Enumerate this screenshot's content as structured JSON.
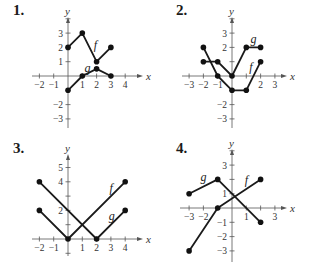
{
  "chart_data": [
    {
      "type": "line",
      "number": "1.",
      "unit_px": 14.3,
      "origin_px": [
        68,
        76
      ],
      "xlim": [
        -2,
        4
      ],
      "ylim": [
        -3,
        4
      ],
      "x_axis_px": [
        32,
        140
      ],
      "y_axis_px": [
        20,
        128
      ],
      "x_ticks": [
        -2,
        -1,
        1,
        2,
        3,
        4
      ],
      "y_ticks": [
        -3,
        -2,
        1,
        2,
        3,
        4
      ],
      "x_tick_labels": [
        "-2",
        "-1",
        "1",
        "2",
        "3",
        "4"
      ],
      "y_tick_labels": [
        "-3",
        "-2",
        "1",
        "2",
        "3",
        ""
      ],
      "xlabel": "x",
      "ylabel": "y",
      "series": [
        {
          "name": "f",
          "points": [
            [
              0,
              2
            ],
            [
              1,
              3
            ],
            [
              2,
              1
            ],
            [
              3,
              2
            ]
          ],
          "label_pos": [
            1.8,
            1.9
          ]
        },
        {
          "name": "g",
          "points": [
            [
              0,
              -1
            ],
            [
              1,
              0
            ],
            [
              2,
              0.5
            ],
            [
              3,
              0
            ]
          ],
          "label_pos": [
            1.15,
            0.3
          ]
        }
      ]
    },
    {
      "type": "line",
      "number": "2.",
      "unit_px": 14.3,
      "origin_px": [
        232,
        76
      ],
      "xlim": [
        -3,
        3
      ],
      "ylim": [
        -3,
        4
      ],
      "x_axis_px": [
        182,
        284
      ],
      "y_axis_px": [
        20,
        128
      ],
      "x_ticks": [
        -3,
        -2,
        -1,
        1,
        2,
        3
      ],
      "y_ticks": [
        -3,
        -2,
        -1,
        1,
        2,
        3,
        4
      ],
      "x_tick_labels": [
        "-3",
        "-2",
        "-1",
        "",
        "2",
        "3"
      ],
      "y_tick_labels": [
        "-3",
        "-2",
        "",
        "",
        "2",
        "3",
        ""
      ],
      "xlabel": "x",
      "ylabel": "y",
      "series": [
        {
          "name": "g",
          "points": [
            [
              -2,
              1
            ],
            [
              -1,
              1
            ],
            [
              0,
              0
            ],
            [
              1,
              2
            ],
            [
              2,
              2
            ]
          ],
          "label_pos": [
            1.3,
            2.3
          ]
        },
        {
          "name": "f",
          "points": [
            [
              -2,
              2
            ],
            [
              -1,
              0
            ],
            [
              0,
              -1
            ],
            [
              1,
              -1
            ],
            [
              2,
              1
            ]
          ],
          "label_pos": [
            1.2,
            0.35
          ]
        }
      ]
    },
    {
      "type": "line",
      "number": "3.",
      "unit_px": 14.3,
      "origin_px": [
        68,
        239
      ],
      "xlim": [
        -2,
        4
      ],
      "ylim": [
        -1,
        6
      ],
      "x_axis_px": [
        32,
        140
      ],
      "y_axis_px": [
        157,
        256
      ],
      "x_ticks": [
        -2,
        -1,
        1,
        2,
        3,
        4
      ],
      "y_ticks": [
        -1,
        1,
        2,
        3,
        4,
        5
      ],
      "x_tick_labels": [
        "-2",
        "-1",
        "1",
        "2",
        "3",
        "4"
      ],
      "y_tick_labels": [
        "",
        "",
        "2",
        "",
        "4",
        "5"
      ],
      "xlabel": "x",
      "ylabel": "y",
      "series": [
        {
          "name": "f",
          "points": [
            [
              -2,
              2
            ],
            [
              0,
              0
            ],
            [
              4,
              4
            ]
          ],
          "label_pos": [
            2.9,
            3.3
          ]
        },
        {
          "name": "g",
          "points": [
            [
              -2,
              4
            ],
            [
              2,
              0
            ],
            [
              4,
              2
            ]
          ],
          "label_pos": [
            2.85,
            1.3
          ]
        }
      ]
    },
    {
      "type": "line",
      "number": "4.",
      "unit_px": 14.3,
      "origin_px": [
        232,
        208
      ],
      "xlim": [
        -3,
        3
      ],
      "ylim": [
        -3,
        4
      ],
      "x_axis_px": [
        180,
        284
      ],
      "y_axis_px": [
        152,
        262
      ],
      "x_ticks": [
        -3,
        -2,
        -1,
        1,
        2,
        3
      ],
      "y_ticks": [
        -3,
        -2,
        -1,
        1,
        2,
        3,
        4
      ],
      "x_tick_labels": [
        "-3",
        "-2",
        "",
        "1",
        "",
        "3"
      ],
      "y_tick_labels": [
        "-3",
        "-2",
        "-1",
        "1",
        "",
        "3",
        ""
      ],
      "xlabel": "x",
      "ylabel": "y",
      "series": [
        {
          "name": "g",
          "points": [
            [
              -3,
              1
            ],
            [
              -1,
              2
            ],
            [
              2,
              -1
            ]
          ],
          "label_pos": [
            -2.2,
            1.9
          ]
        },
        {
          "name": "f",
          "points": [
            [
              -3,
              -3
            ],
            [
              -1,
              0
            ],
            [
              2,
              2
            ]
          ],
          "label_pos": [
            0.9,
            1.7
          ]
        }
      ]
    }
  ],
  "style": {
    "line_color": "#1a1a1a",
    "axis_color": "#555555",
    "point_color": "#111111"
  }
}
